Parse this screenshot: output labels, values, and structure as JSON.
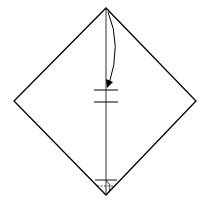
{
  "diagram": {
    "type": "origami-step",
    "colors": {
      "line": "#000000",
      "paper": "#ffffff"
    },
    "elements": {
      "paper": "diamond-square",
      "crease": "vertical-valley-crease",
      "fold_arrow": "top-corner-to-center",
      "reference_marks": [
        "center-tick-upper",
        "center-tick-lower"
      ],
      "bottom_marker": "bottom-tip-fold-marker"
    }
  }
}
